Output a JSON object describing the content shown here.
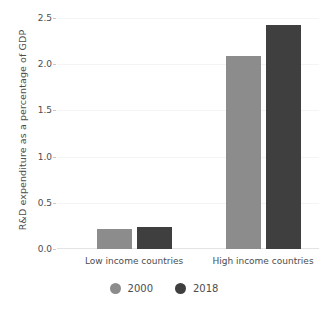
{
  "chart_data": {
    "type": "bar",
    "title": "",
    "subtitle": "",
    "xlabel": "",
    "ylabel": "R&D expenditure as a percentage of GDP",
    "categories": [
      "Low income countries",
      "High income countries"
    ],
    "series": [
      {
        "name": "2000",
        "color": "#8c8c8c",
        "values": [
          0.22,
          2.09
        ]
      },
      {
        "name": "2018",
        "color": "#3f3f3f",
        "values": [
          0.24,
          2.42
        ]
      }
    ],
    "ylim": [
      0.0,
      2.5
    ],
    "ytick_labels": [
      "0.0",
      "0.5",
      "1.0",
      "1.5",
      "2.0",
      "2.5"
    ],
    "ytick_values": [
      0.0,
      0.5,
      1.0,
      1.5,
      2.0,
      2.5
    ],
    "grid": true,
    "grid_axis": "y",
    "legend_position": "bottom-center",
    "background_color": "#ffffff",
    "text_color": "#4d4d4d"
  }
}
